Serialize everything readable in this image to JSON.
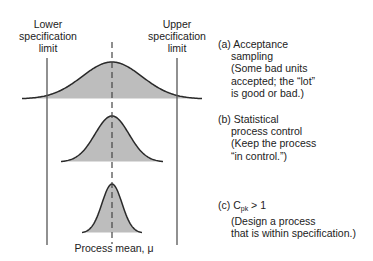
{
  "diagram": {
    "lower_spec": {
      "line1": "Lower",
      "line2": "specification",
      "line3": "limit"
    },
    "upper_spec": {
      "line1": "Upper",
      "line2": "specification",
      "line3": "limit"
    },
    "mean_label": "Process mean, μ",
    "colors": {
      "fill": "#bdbdbd",
      "stroke": "#2a2a2a",
      "limit_line": "#555555",
      "mean_line": "#444444"
    },
    "curves": [
      {
        "id": "a",
        "center_x": 112,
        "baseline_y": 99,
        "peak_y": 62,
        "sigma": 30
      },
      {
        "id": "b",
        "center_x": 112,
        "baseline_y": 162,
        "peak_y": 116,
        "sigma": 17
      },
      {
        "id": "c",
        "center_x": 112,
        "baseline_y": 233,
        "peak_y": 184,
        "sigma": 10
      }
    ],
    "captions": {
      "a": {
        "label": "(a)",
        "title1": "Acceptance",
        "title2": "sampling",
        "note1": "(Some bad units",
        "note2": "accepted; the “lot”",
        "note3": "is good or bad.)"
      },
      "b": {
        "label": "(b)",
        "title1": "Statistical",
        "title2": "process control",
        "note1": "(Keep the process",
        "note2": "“in control.”)"
      },
      "c": {
        "label": "(c)",
        "c_main": "C",
        "c_sub": "pk",
        "c_rest": " > 1",
        "note1": "(Design a process",
        "note2": "that is within specification.)"
      }
    }
  }
}
